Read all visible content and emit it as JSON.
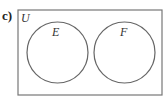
{
  "part_label": "c)",
  "diagram": {
    "type": "venn",
    "universal_set": {
      "label": "U",
      "x": 18,
      "y": 10,
      "width": 144,
      "height": 85
    },
    "sets": [
      {
        "label": "E",
        "cx": 57.5,
        "cy": 52.5,
        "r": 30.5,
        "label_x": 52,
        "label_y": 36
      },
      {
        "label": "F",
        "cx": 124.5,
        "cy": 52.5,
        "r": 30.5,
        "label_x": 120,
        "label_y": 36
      }
    ],
    "relationship": "disjoint",
    "stroke_color": "#666666"
  }
}
